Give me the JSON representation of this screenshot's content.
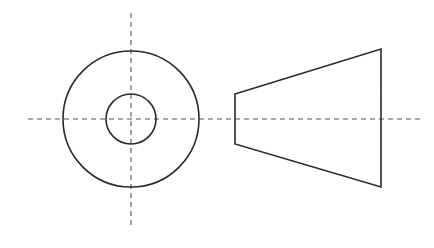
{
  "drawing": {
    "type": "orthographic-projection",
    "subject": "truncated cone (frustum) with through hole",
    "colors": {
      "outline": "#2a2a2a",
      "centerline": "#555555",
      "background": "#ffffff"
    },
    "front_view": {
      "center": [
        131,
        119
      ],
      "outer_circle_radius": 68,
      "inner_circle_radius": 25,
      "vertical_centerline": {
        "x": 131,
        "y1": 13,
        "y2": 226
      }
    },
    "side_view": {
      "trapezoid_points": [
        [
          235,
          94
        ],
        [
          381,
          49
        ],
        [
          381,
          187
        ],
        [
          235,
          144
        ]
      ]
    },
    "horizontal_centerline": {
      "y": 119,
      "x1": 28,
      "x2": 420
    }
  }
}
